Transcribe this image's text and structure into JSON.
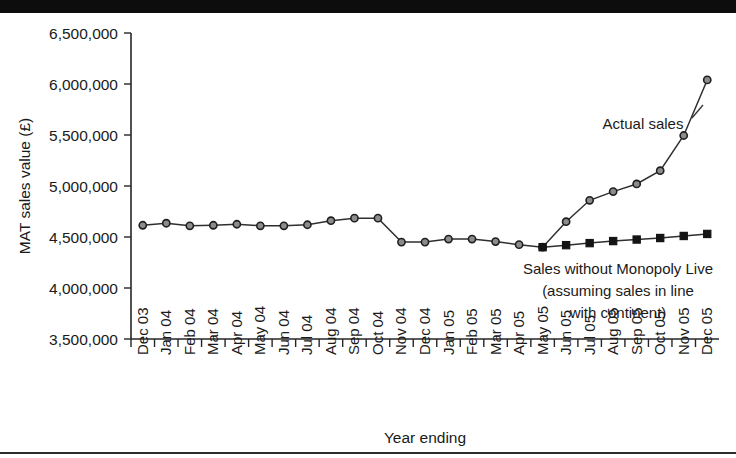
{
  "figure": {
    "background_color": "#ffffff",
    "top_bar_color": "#0d0d0d",
    "bottom_rule_color": "#2b2b2b"
  },
  "chart_data": {
    "type": "line",
    "title": "",
    "xlabel": "Year ending",
    "ylabel": "MAT sales value (£)",
    "ylim": [
      3500000,
      6500000
    ],
    "ytick_labels": [
      "3,500,000",
      "4,000,000",
      "4,500,000",
      "5,000,000",
      "5,500,000",
      "6,000,000",
      "6,500,000"
    ],
    "ytick_values": [
      3500000,
      4000000,
      4500000,
      5000000,
      5500000,
      6000000,
      6500000
    ],
    "grid": false,
    "legend_position": "inline-annotation",
    "categories": [
      "Dec 03",
      "Jan 04",
      "Feb 04",
      "Mar 04",
      "Apr 04",
      "May 04",
      "Jun 04",
      "Jul 04",
      "Aug 04",
      "Sep 04",
      "Oct 04",
      "Nov 04",
      "Dec 04",
      "Jan 05",
      "Feb 05",
      "Mar 05",
      "Apr 05",
      "May 05",
      "Jun 05",
      "Jul 05",
      "Aug 05",
      "Sep 05",
      "Oct 05",
      "Nov 05",
      "Dec 05"
    ],
    "series": [
      {
        "name": "Actual sales",
        "marker": "circle",
        "marker_fill": "#8c8c8c",
        "line_color": "#2f2f2f",
        "values": [
          4615000,
          4635000,
          4610000,
          4615000,
          4625000,
          4610000,
          4610000,
          4620000,
          4660000,
          4685000,
          4685000,
          4450000,
          4450000,
          4480000,
          4480000,
          4455000,
          4425000,
          4400000,
          4650000,
          4860000,
          4945000,
          5020000,
          5150000,
          5495000,
          6040000
        ]
      },
      {
        "name": "Sales without Monopoly Live",
        "marker": "square",
        "marker_fill": "#141414",
        "line_color": "#2f2f2f",
        "start_index": 17,
        "values": [
          null,
          null,
          null,
          null,
          null,
          null,
          null,
          null,
          null,
          null,
          null,
          null,
          null,
          null,
          null,
          null,
          null,
          4400000,
          4420000,
          4440000,
          4460000,
          4475000,
          4490000,
          4510000,
          4530000
        ]
      }
    ],
    "annotations": [
      {
        "id": "actual-sales",
        "text": "Actual sales"
      },
      {
        "id": "counterfactual-line1",
        "text": "Sales without Monopoly Live"
      },
      {
        "id": "counterfactual-line2",
        "text": "(assuming sales in line"
      },
      {
        "id": "counterfactual-line3",
        "text": "with continent)"
      }
    ]
  }
}
